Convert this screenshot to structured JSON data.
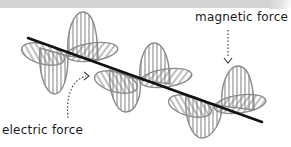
{
  "diagram": {
    "labels": {
      "magnetic": "magnetic force",
      "electric": "electric force"
    },
    "colors": {
      "axis": "#111111",
      "wave": "#8a8a8a",
      "band": "#d4d4d4",
      "background": "#ffffff"
    }
  }
}
